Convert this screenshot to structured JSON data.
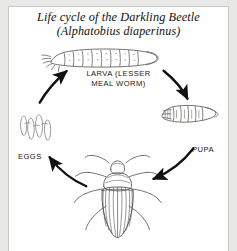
{
  "figure": {
    "title_main": "Life cycle of the Darkling Beetle",
    "title_sub": "(Alphatobius diaperinus)",
    "labels": {
      "larva": "LARVA (LESSER\nMEAL WORM)",
      "eggs": "EGGS",
      "pupa": "PUPA"
    },
    "colors": {
      "ink": "#1a1816",
      "arrow": "#111111",
      "plate_background": "#ffffff",
      "frame": "#e8e8e6",
      "frame_line": "#c9c9c7",
      "drawing_line": "#6e6a66"
    },
    "stages": [
      {
        "name": "eggs",
        "label": "EGGS",
        "order": 1
      },
      {
        "name": "larva",
        "label": "LARVA (LESSER MEAL WORM)",
        "order": 2
      },
      {
        "name": "pupa",
        "label": "PUPA",
        "order": 3
      },
      {
        "name": "adult-beetle",
        "label": "",
        "order": 4
      }
    ],
    "arrows": [
      {
        "from": "eggs",
        "to": "larva",
        "direction": "up-right"
      },
      {
        "from": "larva",
        "to": "pupa",
        "direction": "down-right"
      },
      {
        "from": "pupa",
        "to": "adult-beetle",
        "direction": "down-left"
      },
      {
        "from": "adult-beetle",
        "to": "eggs",
        "direction": "up-left"
      }
    ]
  }
}
